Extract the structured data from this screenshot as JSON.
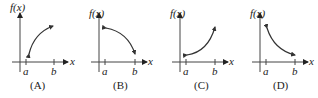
{
  "panels": [
    {
      "caption": "(A)",
      "ylabel": "f(x)",
      "xlabel": "x",
      "a": "a",
      "b": "b",
      "shape": "increasing-concave-down"
    },
    {
      "caption": "(B)",
      "ylabel": "f(x)",
      "xlabel": "x",
      "a": "a",
      "b": "b",
      "shape": "decreasing-concave-down"
    },
    {
      "caption": "(C)",
      "ylabel": "f(x)",
      "xlabel": "x",
      "a": "a",
      "b": "b",
      "shape": "increasing-concave-up"
    },
    {
      "caption": "(D)",
      "ylabel": "f(x)",
      "xlabel": "x",
      "a": "a",
      "b": "b",
      "shape": "decreasing-concave-up"
    }
  ],
  "colors": {
    "axis": "#444444",
    "curve": "#333333",
    "text": "#222222"
  }
}
